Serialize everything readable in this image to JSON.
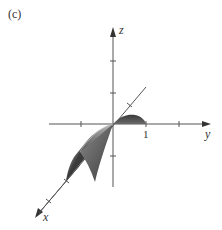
{
  "figure": {
    "panel_label": "(c)",
    "axes": {
      "x_label": "x",
      "y_label": "y",
      "z_label": "z",
      "y_tick_label": "1"
    },
    "colors": {
      "axis": "#555555",
      "surface_dark": "#3a3a3a",
      "surface_mid": "#6e6e6e",
      "surface_light": "#b5b5b5",
      "text": "#333333"
    }
  }
}
